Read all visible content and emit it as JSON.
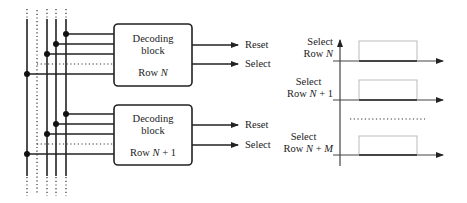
{
  "colors": {
    "line": "#222222",
    "pulse": "#bbbbbb",
    "axis": "#555555"
  },
  "left_diagram": {
    "bus_lines": [
      {
        "x": 27,
        "style": "solid"
      },
      {
        "x": 37,
        "style": "dotted"
      },
      {
        "x": 47,
        "style": "solid"
      },
      {
        "x": 56,
        "style": "solid"
      },
      {
        "x": 66,
        "style": "solid"
      }
    ],
    "blocks": [
      {
        "title_line1": "Decoding",
        "title_line2": "block",
        "row_prefix": "Row ",
        "row_var": "N",
        "row_suffix": "",
        "outputs": [
          {
            "label": "Reset"
          },
          {
            "label": "Select"
          }
        ]
      },
      {
        "title_line1": "Decoding",
        "title_line2": "block",
        "row_prefix": "Row ",
        "row_var": "N",
        "row_suffix": " + 1",
        "outputs": [
          {
            "label": "Reset"
          },
          {
            "label": "Select"
          }
        ]
      }
    ]
  },
  "timing_diagram": {
    "signals": [
      {
        "line1": "Select",
        "line2_prefix": "Row ",
        "line2_var": "N",
        "line2_suffix": ""
      },
      {
        "line1": "Select",
        "line2_prefix": "Row ",
        "line2_var": "N",
        "line2_suffix": " + 1"
      },
      {
        "line1": "Select",
        "line2_prefix": "Row ",
        "line2_var": "N",
        "line2_suffix": " + ",
        "line2_var2": "M"
      }
    ],
    "ellipsis": "dotted-separator"
  }
}
